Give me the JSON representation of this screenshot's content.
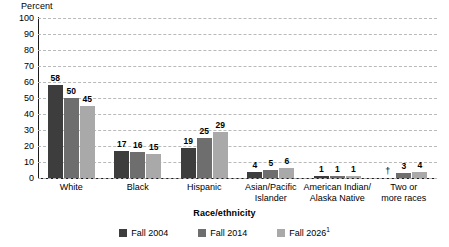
{
  "chart_data": {
    "type": "bar",
    "title": "",
    "xlabel": "Race/ethnicity",
    "ylabel": "Percent",
    "ylim": [
      0,
      100
    ],
    "ytick_step": 10,
    "yticks": [
      "100",
      "90",
      "80",
      "70",
      "60",
      "50",
      "40",
      "30",
      "20",
      "10",
      "0"
    ],
    "grid": true,
    "legend_position": "bottom",
    "categories": [
      "White",
      "Black",
      "Hispanic",
      "Asian/Pacific\nIslander",
      "American Indian/\nAlaska Native",
      "Two or\nmore races"
    ],
    "series": [
      {
        "name": "Fall 2004",
        "color": "#3d3d3d",
        "values": [
          58,
          17,
          19,
          4,
          1,
          null
        ],
        "labels": [
          "58",
          "17",
          "19",
          "4",
          "1",
          "†"
        ]
      },
      {
        "name": "Fall 2014",
        "color": "#6e6e6e",
        "values": [
          50,
          16,
          25,
          5,
          1,
          3
        ],
        "labels": [
          "50",
          "16",
          "25",
          "5",
          "1",
          "3"
        ]
      },
      {
        "name": "Fall 2026",
        "color": "#a9a9a9",
        "values": [
          45,
          15,
          29,
          6,
          1,
          4
        ],
        "labels": [
          "45",
          "15",
          "29",
          "6",
          "1",
          "4"
        ]
      }
    ],
    "annotations": [
      {
        "symbol": "†",
        "category": "Two or more races",
        "series": "Fall 2004",
        "meaning": "not applicable"
      }
    ]
  },
  "legend": {
    "items": [
      {
        "label": "Fall 2004",
        "superscript": "",
        "color": "#3d3d3d"
      },
      {
        "label": "Fall 2014",
        "superscript": "",
        "color": "#6e6e6e"
      },
      {
        "label": "Fall 2026",
        "superscript": "1",
        "color": "#a9a9a9"
      }
    ]
  },
  "axes": {
    "y_title": "Percent",
    "x_title": "Race/ethnicity"
  },
  "colors": {
    "series_0": "#3d3d3d",
    "series_1": "#6e6e6e",
    "series_2": "#a9a9a9",
    "grid": "#b9b9b9",
    "axis": "#1a1a1a",
    "background": "#ffffff"
  }
}
